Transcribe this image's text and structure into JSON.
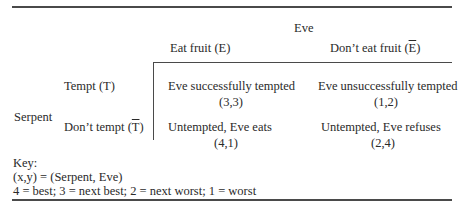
{
  "table": {
    "column_player": "Eve",
    "row_player": "Serpent",
    "columns": [
      {
        "label": "Eat fruit (",
        "symbol": "E",
        "close": ")",
        "barred": false
      },
      {
        "label": "Don’t eat fruit (",
        "symbol": "E",
        "close": ")",
        "barred": true
      }
    ],
    "rows": [
      {
        "label": "Tempt (",
        "symbol": "T",
        "close": ")",
        "barred": false
      },
      {
        "label": "Don’t tempt (",
        "symbol": "T",
        "close": ")",
        "barred": true
      }
    ],
    "cells": [
      [
        {
          "outcome": "Eve successfully tempted",
          "payoff": "(3,3)"
        },
        {
          "outcome": "Eve unsuccessfully tempted",
          "payoff": "(1,2)"
        }
      ],
      [
        {
          "outcome": "Untempted, Eve eats",
          "payoff": "(4,1)"
        },
        {
          "outcome": "Untempted, Eve refuses",
          "payoff": "(2,4)"
        }
      ]
    ]
  },
  "key": {
    "title": "Key:",
    "line1": "(x,y) = (Serpent, Eve)",
    "line2": "4 = best; 3 = next best; 2 = next worst; 1 = worst"
  }
}
